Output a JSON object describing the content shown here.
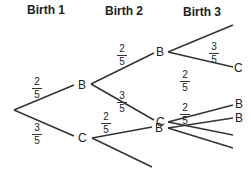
{
  "headers": [
    "Birth 1",
    "Birth 2",
    "Birth 3"
  ],
  "nodes": {
    "b1_B": "B",
    "b1_C": "C",
    "b2_B": "B",
    "b2_C": "C",
    "b2_B2": "B",
    "b3_C": "C",
    "b3_B": "B",
    "b3_B2": "B"
  },
  "fractions": {
    "root_B": {
      "num": "2",
      "den": "5"
    },
    "root_C": {
      "num": "3",
      "den": "5"
    },
    "B_B": {
      "num": "2",
      "den": "5"
    },
    "B_C": {
      "num": "3",
      "den": "5"
    },
    "C_B": {
      "num": "2",
      "den": "5"
    },
    "BB_C": {
      "num": "3",
      "den": "5"
    },
    "BC_B": {
      "num": "2",
      "den": "5"
    },
    "CB_B": {
      "num": "2",
      "den": "5"
    }
  },
  "colors": {
    "line": "#333333",
    "text": "#222222"
  }
}
